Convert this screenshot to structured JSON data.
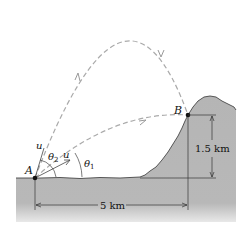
{
  "diagram": {
    "points": {
      "A": "A",
      "B": "B"
    },
    "velocity_labels": {
      "upper": "u",
      "lower": "u"
    },
    "angle_labels": {
      "theta2": "θ",
      "theta2_sub": "2",
      "theta1": "θ",
      "theta1_sub": "1"
    },
    "dimensions": {
      "height": "1.5 km",
      "horizontal": "5 km"
    },
    "trajectories": [
      "high-angle trajectory (θ2)",
      "low-angle trajectory (θ1)"
    ],
    "colors": {
      "ground": "#b3b3b3",
      "ground_edge": "#333333",
      "trajectory": "#aaaaaa",
      "ink": "#111111"
    }
  }
}
